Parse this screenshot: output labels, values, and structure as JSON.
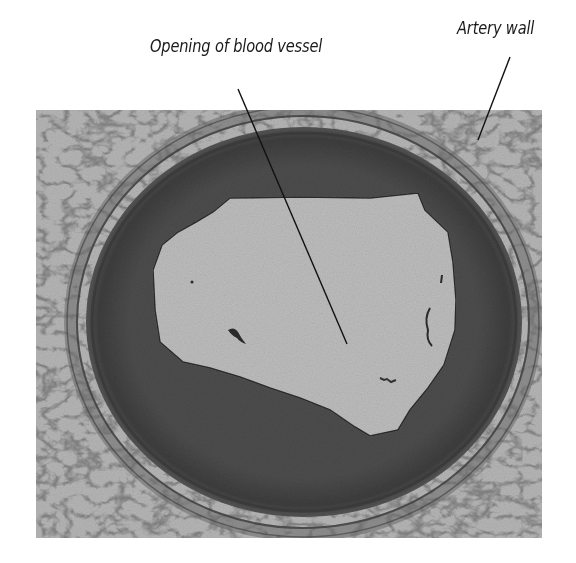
{
  "figure": {
    "type": "micrograph",
    "labels": [
      {
        "id": "opening",
        "text": "Opening of blood vessel"
      },
      {
        "id": "wall",
        "text": "Artery wall"
      }
    ]
  },
  "colors": {
    "background": "#ffffff",
    "tissue_light": "#b4b4b4",
    "lumen": "#bdbdbd",
    "wall_media": "#4a4a4a",
    "wall_dark": "#3a3a3a",
    "leader_line": "#111111"
  }
}
